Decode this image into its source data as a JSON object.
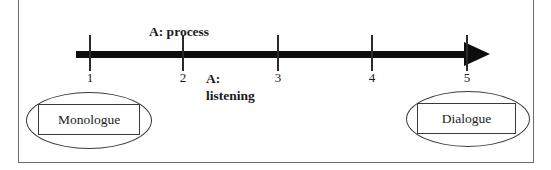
{
  "diagram": {
    "timeline": {
      "tick_labels": [
        "1",
        "2",
        "3",
        "4",
        "5"
      ],
      "direction": "left-to-right"
    },
    "annotations": {
      "process": "A: process",
      "listening": "A:\nlistening"
    },
    "nodes": {
      "left_label": "Monologue",
      "right_label": "Dialogue"
    },
    "colors": {
      "arrow": "#0d0d0d",
      "outline": "#3a3a3a",
      "frame": "#6b6b6b",
      "background": "#ffffff"
    }
  }
}
